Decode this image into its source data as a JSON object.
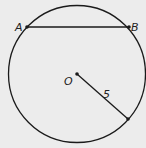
{
  "diagram": {
    "type": "circle-geometry",
    "background": "#ececec",
    "stroke_color": "#1a1a1a",
    "circle": {
      "center_label": "O",
      "radius_label": "5"
    },
    "chord": {
      "endpoint_a": "A",
      "endpoint_b": "B"
    },
    "labels": {
      "a": "A",
      "b": "B",
      "o": "O",
      "radius": "5"
    }
  }
}
